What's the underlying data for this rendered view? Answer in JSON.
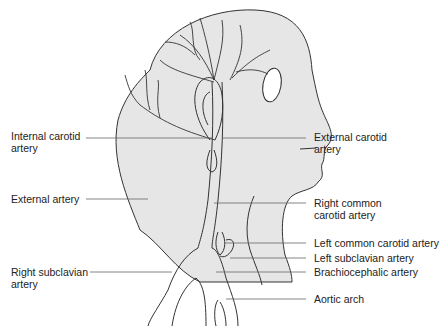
{
  "diagram": {
    "colors": {
      "head_fill": "#e6e6e6",
      "line": "#333333",
      "leader": "#666666"
    },
    "labels": {
      "left": [
        {
          "id": "internal-carotid",
          "text": "Internal carotid\nartery"
        },
        {
          "id": "external-artery",
          "text": "External artery"
        },
        {
          "id": "right-subclavian",
          "text": "Right subclavian\nartery"
        }
      ],
      "right": [
        {
          "id": "external-carotid",
          "text": "External carotid\nartery"
        },
        {
          "id": "right-common-carotid",
          "text": "Right common\ncarotid artery"
        },
        {
          "id": "left-common-carotid",
          "text": "Left common carotid artery"
        },
        {
          "id": "left-subclavian",
          "text": "Left subclavian artery"
        },
        {
          "id": "brachiocephalic",
          "text": "Brachiocephalic artery"
        },
        {
          "id": "aortic-arch",
          "text": "Aortic arch"
        }
      ]
    }
  }
}
